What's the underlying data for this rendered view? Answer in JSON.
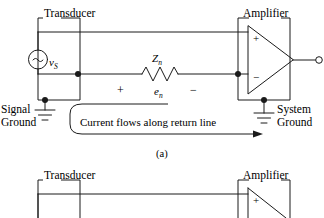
{
  "figure": {
    "caption_a": "(a)",
    "panels": [
      {
        "id": "a",
        "transducer_label": "Transducer",
        "amplifier_label": "Amplifier",
        "source_symbol": "~",
        "source_label_main": "v",
        "source_label_sub": "S",
        "impedance_label_main": "Z",
        "impedance_label_sub": "n",
        "noise_voltage_main": "e",
        "noise_voltage_sub": "n",
        "polarity_plus": "+",
        "polarity_minus": "−",
        "opamp_plus": "+",
        "opamp_minus": "−",
        "signal_ground_line1": "Signal",
        "signal_ground_line2": "Ground",
        "system_ground_line1": "System",
        "system_ground_line2": "Ground",
        "annotation": "Current flows along return line"
      },
      {
        "id": "b",
        "transducer_label": "Transducer",
        "amplifier_label": "Amplifier",
        "opamp_plus": "+"
      }
    ]
  },
  "colors": {
    "ink": "#1a1a1a",
    "background": "#ffffff"
  },
  "icons": {
    "ground": "ground-symbol",
    "ac_source": "ac-voltage-source-icon",
    "resistor": "resistor-zigzag-icon",
    "opamp": "opamp-triangle-icon",
    "arrow": "arrow-right-icon"
  }
}
